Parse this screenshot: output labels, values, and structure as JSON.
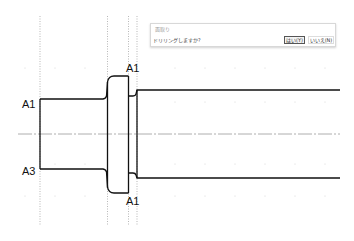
{
  "drawing": {
    "labels": [
      {
        "text": "A1",
        "x": 22,
        "y": 108,
        "anchor": "left-top-edge"
      },
      {
        "text": "A3",
        "x": 22,
        "y": 175,
        "anchor": "left-bottom-edge"
      },
      {
        "text": "A1",
        "x": 126,
        "y": 72,
        "anchor": "flange-top"
      },
      {
        "text": "A1",
        "x": 126,
        "y": 205,
        "anchor": "flange-bottom"
      }
    ],
    "colors": {
      "profile": "#111111",
      "centerline": "#9a9a9a",
      "construction": "#9a9a9a",
      "grid": "#cfcfcf",
      "background": "#ffffff"
    }
  },
  "dialog": {
    "title": "面取り",
    "message": "ドリリングしますか?",
    "yes_label": "はい(Y)",
    "no_label": "いいえ(N)"
  }
}
